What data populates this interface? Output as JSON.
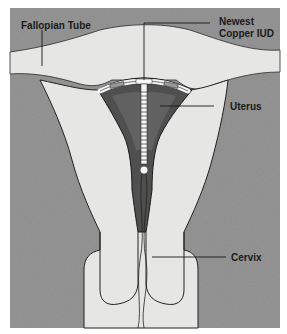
{
  "diagram": {
    "labels": {
      "fallopian_tube": "Fallopian Tube",
      "iud_line1": "Newest",
      "iud_line2": "Copper IUD",
      "uterus": "Uterus",
      "cervix": "Cervix"
    },
    "colors": {
      "tissue": "#8a8a8a",
      "organ": "#e4e4e2",
      "cavity": "#5a5a5a",
      "outline": "#222222",
      "iud": "#f2f2f2",
      "background": "#ffffff"
    }
  }
}
